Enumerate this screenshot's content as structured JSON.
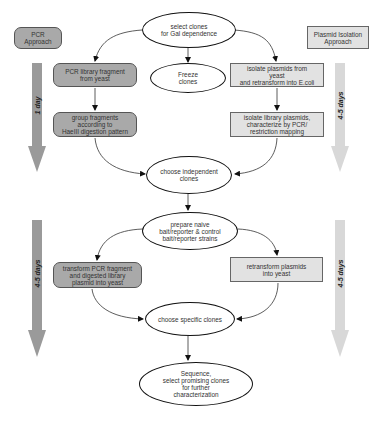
{
  "diagram": {
    "approaches": {
      "left": "PCR\nApproach",
      "right": "Plasmid Isolation\nApproach"
    },
    "timelines": {
      "left_top": "1 day",
      "left_bottom": "4-5 days",
      "right_top": "4-5 days",
      "right_bottom": "4-5 days"
    },
    "nodes": {
      "select_clones": "select clones\nfor Gal dependence",
      "freeze_clones": "Freeze\nclones",
      "pcr_library_fragment": "PCR library fragment\nfrom yeast",
      "isolate_plasmids": "isolate plasmids from\nyeast\nand retransform into E.coli",
      "group_fragments": "group fragments\naccording to\nHaeIII digestion pattern",
      "isolate_library_plasmids": "isolate library plasmids,\ncharacterize by PCR/\nrestriction mapping",
      "choose_independent": "choose independent\nclones",
      "prepare_naive": "prepare naive\nbait/reporter & control\nbait/reporter strains",
      "transform_pcr": "transform PCR fragment\nand digested library\nplasmid into yeast",
      "retransform_plasmids": "retransform plasmids\ninto yeast",
      "choose_specific": "choose specific clones",
      "sequence": "Sequence,\nselect promising clones\nfor further\ncharacterization"
    },
    "colors": {
      "pcr_box": "#a9a9a9",
      "plasmid_box": "#e2e2e2",
      "left_arrow": "#9a9a9a",
      "right_arrow": "#d8d8d8"
    }
  }
}
